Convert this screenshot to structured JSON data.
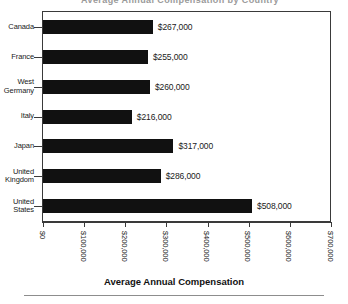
{
  "figure": {
    "title_remnant": "Average Annual Compensation by Country",
    "axis_title": "Average Annual Compensation",
    "background_color": "#ffffff",
    "bar_color": "#111111",
    "axis_color": "#3a3a3a",
    "footer_rule_color": "#8d8d8d"
  },
  "chart_data": {
    "type": "bar",
    "orientation": "horizontal",
    "title": "Average Annual Compensation",
    "xlabel": "Average Annual Compensation",
    "ylabel": "",
    "xlim": [
      0,
      700000
    ],
    "grid": false,
    "legend": "none",
    "categories": [
      "Canada",
      "France",
      "West Germany",
      "Italy",
      "Japan",
      "United Kingdom",
      "United States"
    ],
    "category_lines": [
      [
        "Canada"
      ],
      [
        "France"
      ],
      [
        "West",
        "Germany"
      ],
      [
        "Italy"
      ],
      [
        "Japan"
      ],
      [
        "United",
        "Kingdom"
      ],
      [
        "United",
        "States"
      ]
    ],
    "values": [
      267000,
      255000,
      260000,
      216000,
      317000,
      286000,
      508000
    ],
    "value_labels": [
      "$267,000",
      "$255,000",
      "$260,000",
      "$216,000",
      "$317,000",
      "$286,000",
      "$508,000"
    ],
    "xticks": [
      0,
      100000,
      200000,
      300000,
      400000,
      500000,
      600000,
      700000
    ],
    "xtick_labels": [
      "$0",
      "$100,000",
      "$200,000",
      "$300,000",
      "$400,000",
      "$500,000",
      "$600,000",
      "$700,000"
    ]
  }
}
